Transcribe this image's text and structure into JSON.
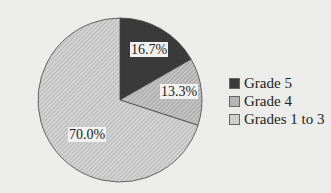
{
  "chart_data": {
    "type": "pie",
    "title": "",
    "categories": [
      "Grade 5",
      "Grade 4",
      "Grades 1 to 3"
    ],
    "values": [
      16.7,
      13.3,
      70.0
    ],
    "labels": [
      "16.7%",
      "13.3%",
      "70.0%"
    ],
    "colors": [
      "#3a3a3a",
      "#b5b5b5",
      "#cfcfcf"
    ],
    "legend_position": "right",
    "start_angle_deg": 90,
    "direction": "clockwise"
  },
  "legend": [
    {
      "label": "Grade 5",
      "color": "#3a3a3a"
    },
    {
      "label": "Grade 4",
      "color": "#b5b5b5"
    },
    {
      "label": "Grades 1 to 3",
      "color": "#cfcfcf"
    }
  ]
}
